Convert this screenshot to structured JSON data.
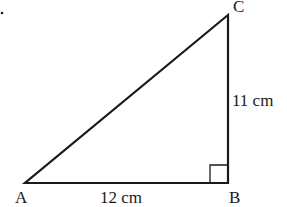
{
  "diagram": {
    "type": "right-triangle",
    "vertices": {
      "A": {
        "label": "A",
        "x": 25,
        "y": 183
      },
      "B": {
        "label": "B",
        "x": 228,
        "y": 183
      },
      "C": {
        "label": "C",
        "x": 228,
        "y": 15
      }
    },
    "sides": {
      "AB": {
        "label": "12 cm"
      },
      "BC": {
        "label": "11 cm"
      }
    },
    "right_angle_at": "B",
    "stroke_color": "#1a1a1a"
  }
}
